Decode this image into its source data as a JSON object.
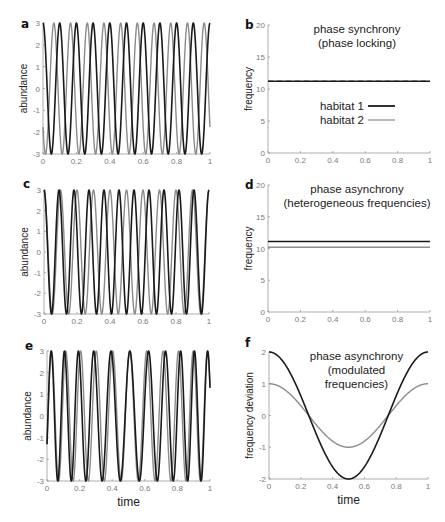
{
  "colors": {
    "habitat1": "#1a1a1a",
    "habitat2": "#8c8c8c",
    "axis": "#9a9a9a"
  },
  "legend": {
    "items": [
      {
        "label": "habitat 1",
        "color": "#1a1a1a"
      },
      {
        "label": "habitat 2",
        "color": "#8c8c8c"
      }
    ]
  },
  "chart_data": [
    {
      "panel": "a",
      "type": "line",
      "title": "",
      "xlabel": "",
      "ylabel": "abundance",
      "xlim": [
        0,
        1
      ],
      "ylim": [
        -3,
        3
      ],
      "xticks": [
        "0",
        "0.2",
        "0.4",
        "0.6",
        "0.8",
        "1"
      ],
      "yticks": [
        "-3",
        "-2",
        "-1",
        "0",
        "1",
        "2",
        "3"
      ],
      "series": [
        {
          "name": "habitat 1",
          "formula": "3*cos(2*pi*10*t)",
          "frequency": 10,
          "phase": 0
        },
        {
          "name": "habitat 2",
          "formula": "3*cos(2*pi*10*t + phi)",
          "frequency": 10,
          "phase": 2.2
        }
      ]
    },
    {
      "panel": "b",
      "type": "line",
      "title": "phase synchrony",
      "subtitle": "(phase locking)",
      "xlabel": "",
      "ylabel": "frequency",
      "xlim": [
        0,
        1
      ],
      "ylim": [
        0,
        20
      ],
      "xticks": [
        "0",
        "0.2",
        "0.4",
        "0.6",
        "0.8",
        "1"
      ],
      "yticks": [
        "0",
        "5",
        "10",
        "15",
        "20"
      ],
      "legend_position": "center",
      "series": [
        {
          "name": "habitat 1",
          "x": [
            0,
            1
          ],
          "y": [
            11.2,
            11.2
          ]
        },
        {
          "name": "habitat 2",
          "x": [
            0,
            1
          ],
          "y": [
            11.2,
            11.2
          ],
          "style": "dashed"
        }
      ]
    },
    {
      "panel": "c",
      "type": "line",
      "title": "",
      "xlabel": "",
      "ylabel": "abundance",
      "xlim": [
        0,
        1
      ],
      "ylim": [
        -3,
        3
      ],
      "xticks": [
        "0",
        "0.2",
        "0.4",
        "0.6",
        "0.8",
        "1"
      ],
      "yticks": [
        "-3",
        "-2",
        "-1",
        "0",
        "1",
        "2",
        "3"
      ],
      "series": [
        {
          "name": "habitat 1",
          "formula": "3*cos(2*pi*11*t)",
          "frequency": 11,
          "phase": 0
        },
        {
          "name": "habitat 2",
          "formula": "3*cos(2*pi*10*t)",
          "frequency": 10,
          "phase": 0
        }
      ]
    },
    {
      "panel": "d",
      "type": "line",
      "title": "phase asynchrony",
      "subtitle": "(heterogeneous frequencies)",
      "xlabel": "",
      "ylabel": "frequency",
      "xlim": [
        0,
        1
      ],
      "ylim": [
        0,
        20
      ],
      "xticks": [
        "0",
        "0.2",
        "0.4",
        "0.6",
        "0.8",
        "1"
      ],
      "yticks": [
        "0",
        "5",
        "10",
        "15",
        "20"
      ],
      "series": [
        {
          "name": "habitat 1",
          "x": [
            0,
            1
          ],
          "y": [
            11.1,
            11.1
          ]
        },
        {
          "name": "habitat 2",
          "x": [
            0,
            1
          ],
          "y": [
            10.2,
            10.2
          ]
        }
      ]
    },
    {
      "panel": "e",
      "type": "line",
      "title": "",
      "xlabel": "time",
      "ylabel": "abundance",
      "xlim": [
        0,
        1
      ],
      "ylim": [
        -3,
        3
      ],
      "xticks": [
        "0",
        "0.2",
        "0.4",
        "0.6",
        "0.8",
        "1"
      ],
      "yticks": [
        "-3",
        "-2",
        "-1",
        "0",
        "1",
        "2",
        "3"
      ],
      "series": [
        {
          "name": "habitat 1",
          "formula": "3*sin(2*pi*(10.5*t + (2/(2*pi))*sin(2*pi*t)) - 0.45)",
          "base_frequency": 10.5,
          "deviation_amplitude": 2
        },
        {
          "name": "habitat 2",
          "formula": "3*sin(2*pi*(10.5*t + (1/(2*pi))*sin(2*pi*t)) - 0.45)",
          "base_frequency": 10.5,
          "deviation_amplitude": 1
        }
      ]
    },
    {
      "panel": "f",
      "type": "line",
      "title": "phase asynchrony",
      "subtitle": "(modulated",
      "subtitle2": "frequencies)",
      "xlabel": "time",
      "ylabel": "frequency deviation",
      "xlim": [
        0,
        1
      ],
      "ylim": [
        -2,
        2
      ],
      "xticks": [
        "0",
        "0.2",
        "0.4",
        "0.6",
        "0.8",
        "1"
      ],
      "yticks": [
        "-2",
        "-1",
        "0",
        "1",
        "2"
      ],
      "series": [
        {
          "name": "habitat 1",
          "formula": "2*cos(2*pi*t)",
          "x": [
            0,
            0.25,
            0.5,
            0.75,
            1
          ],
          "y": [
            2,
            0,
            -2,
            0,
            2
          ]
        },
        {
          "name": "habitat 2",
          "formula": "1*cos(2*pi*t)",
          "x": [
            0,
            0.25,
            0.5,
            0.75,
            1
          ],
          "y": [
            1,
            0,
            -1,
            0,
            1
          ]
        }
      ]
    }
  ],
  "layout": [
    {
      "panel": "a",
      "x0": 43,
      "x1": 210,
      "ytop": 23,
      "ybot": 154,
      "labelX": 21,
      "labelY": 28
    },
    {
      "panel": "b",
      "x0": 268,
      "x1": 430,
      "ytop": 25,
      "ybot": 153,
      "labelX": 245,
      "labelY": 29
    },
    {
      "panel": "c",
      "x0": 44,
      "x1": 209,
      "ytop": 190,
      "ybot": 314,
      "labelX": 23,
      "labelY": 188
    },
    {
      "panel": "d",
      "x0": 268,
      "x1": 430,
      "ytop": 185,
      "ybot": 312,
      "labelX": 245,
      "labelY": 189
    },
    {
      "panel": "e",
      "x0": 47,
      "x1": 210,
      "ytop": 351,
      "ybot": 481,
      "labelX": 25,
      "labelY": 350
    },
    {
      "panel": "f",
      "x0": 269,
      "x1": 428,
      "ytop": 352,
      "ybot": 479,
      "labelX": 245,
      "labelY": 347
    }
  ]
}
